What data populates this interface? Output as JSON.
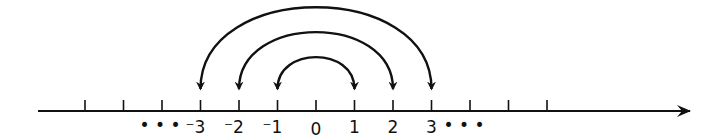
{
  "diagram": {
    "type": "number-line",
    "line_color": "#111111",
    "axis": {
      "start_x": 38,
      "end_x": 690,
      "y": 111,
      "arrow_direction": "right"
    },
    "zero_x": 316,
    "unit_px": 38.5,
    "tick_values": [
      -6,
      -5,
      -4,
      -3,
      -2,
      -1,
      0,
      1,
      2,
      3,
      4,
      5,
      6
    ],
    "labels": [
      {
        "value": -3,
        "text": "⁻3"
      },
      {
        "value": -2,
        "text": "⁻2"
      },
      {
        "value": -1,
        "text": "⁻1"
      },
      {
        "value": 0,
        "text": "0"
      },
      {
        "value": 1,
        "text": "1"
      },
      {
        "value": 2,
        "text": "2"
      },
      {
        "value": 3,
        "text": "3"
      }
    ],
    "ellipsis_left": "• • •",
    "ellipsis_right": "• • •",
    "arcs": [
      {
        "from": 1,
        "to": -1,
        "both_ends_arrow": true,
        "height": 32
      },
      {
        "from": 2,
        "to": -2,
        "both_ends_arrow": true,
        "height": 57
      },
      {
        "from": 3,
        "to": -3,
        "both_ends_arrow": true,
        "height": 82
      }
    ]
  }
}
